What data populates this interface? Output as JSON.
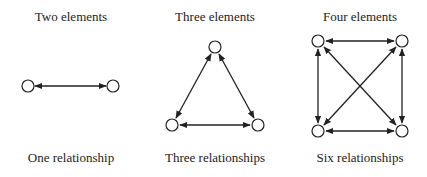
{
  "panels": [
    {
      "title": "Two elements",
      "caption": "One relationship",
      "cx": 71
    },
    {
      "title": "Three elements",
      "caption": "Three relationships",
      "cx": 215
    },
    {
      "title": "Four elements",
      "caption": "Six relationships",
      "cx": 360
    }
  ],
  "style": {
    "stroke": "#222222",
    "node_fill": "#ffffff",
    "node_radius": 6
  }
}
